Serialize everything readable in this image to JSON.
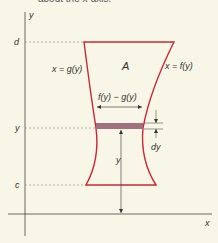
{
  "caption_fragment": "about the x-axis.",
  "axes": {
    "y_label": "y",
    "x_label": "x"
  },
  "levels": {
    "d": "d",
    "y": "y",
    "c": "c"
  },
  "region": {
    "label": "A"
  },
  "curves": {
    "left": "x = g(y)",
    "right": "x = f(y)"
  },
  "strip": {
    "width_label": "f(y) − g(y)",
    "thickness_label": "dy",
    "height_label": "y"
  },
  "colors": {
    "boundary": "#c8283c",
    "strip": "#9e7080",
    "axis": "#444444",
    "background": "#f8f6e6"
  }
}
